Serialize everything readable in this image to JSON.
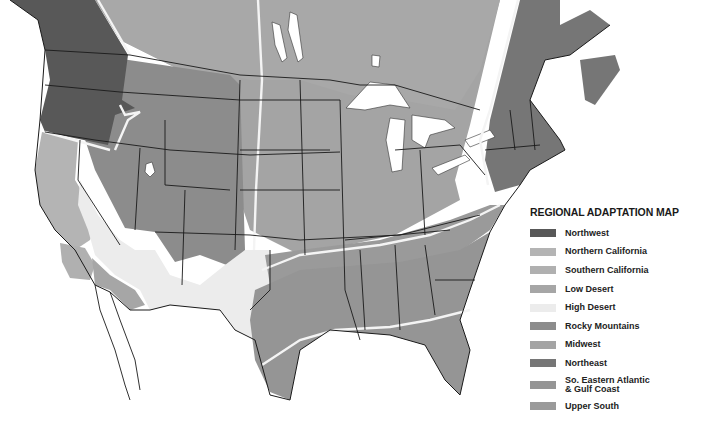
{
  "map": {
    "type": "regional climate zone map",
    "region": "United States and southern Canada",
    "background_color": "#ffffff",
    "border_color": "#1a1a1a",
    "zone_divider_color": "#f4f4f4",
    "water_color": "#ffffff"
  },
  "legend": {
    "title": "REGIONAL ADAPTATION MAP",
    "items": [
      {
        "label": "Northwest",
        "color": "#585858"
      },
      {
        "label": "Northern California",
        "color": "#b4b4b4"
      },
      {
        "label": "Southern California",
        "color": "#b0b0b0"
      },
      {
        "label": "Low Desert",
        "color": "#a6a6a6"
      },
      {
        "label": "High Desert",
        "color": "#ececec"
      },
      {
        "label": "Rocky Mountains",
        "color": "#8c8c8c"
      },
      {
        "label": "Midwest",
        "color": "#a4a4a4"
      },
      {
        "label": "Northeast",
        "color": "#767676"
      },
      {
        "label": "So. Eastern Atlantic\n& Gulf Coast",
        "color": "#959595"
      },
      {
        "label": "Upper South",
        "color": "#9a9a9a"
      }
    ]
  }
}
